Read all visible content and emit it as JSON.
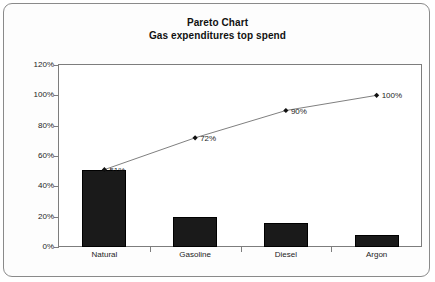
{
  "chart_data": {
    "type": "bar",
    "title": "Pareto Chart",
    "subtitle": "Gas expenditures top spend",
    "xlabel": "",
    "ylabel": "",
    "ylim": [
      0,
      120
    ],
    "ytick_labels": [
      "0%",
      "20%",
      "40%",
      "60%",
      "80%",
      "100%",
      "120%"
    ],
    "ytick_values": [
      0,
      20,
      40,
      60,
      80,
      100,
      120
    ],
    "grid": false,
    "legend": false,
    "categories": [
      "Natural",
      "Gasoline",
      "Diesel",
      "Argon"
    ],
    "series": [
      {
        "name": "Share of spend",
        "type": "bar",
        "values": [
          51,
          20,
          16,
          8
        ],
        "color": "#1a1a1a"
      },
      {
        "name": "Cumulative",
        "type": "line",
        "values": [
          51,
          72,
          90,
          100
        ],
        "labels": [
          "51%",
          "72%",
          "90%",
          "100%"
        ],
        "color": "#808080",
        "marker": "diamond"
      }
    ]
  },
  "card": {
    "border_color": "#8a8a8a",
    "background": "#fdfdfd"
  }
}
